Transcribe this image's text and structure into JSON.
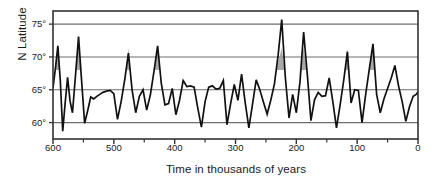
{
  "figure": {
    "background": "#ffffff",
    "line_color": "#111111",
    "fill_color": "#9a9a9a",
    "grid_color": "#6e6e6e",
    "frame_color": "#333333"
  },
  "chart_data": {
    "type": "line",
    "title": "",
    "xlabel": "Time in thousands of years",
    "ylabel": "N Latitude",
    "xlim": [
      600,
      0
    ],
    "ylim": [
      57.5,
      77.0
    ],
    "x_reversed": true,
    "grid": true,
    "grid_y": [
      60,
      65,
      70,
      75
    ],
    "legend": null,
    "xticks": [
      600,
      500,
      400,
      300,
      200,
      100,
      0
    ],
    "xtick_labels": [
      "600",
      "500",
      "400",
      "300",
      "200",
      "100",
      "0"
    ],
    "xminor_ticks": [
      550,
      450,
      350,
      250,
      150,
      50
    ],
    "yticks": [
      60,
      65,
      70,
      75
    ],
    "ytick_labels": [
      "60°",
      "65°",
      "70°",
      "75°"
    ],
    "shaded_band": [
      68.0,
      70.0
    ],
    "series": [
      {
        "name": "N Latitude",
        "x": [
          600,
          596,
          592,
          588,
          584,
          580,
          576,
          572,
          568,
          563,
          558,
          553,
          548,
          543,
          538,
          533,
          528,
          523,
          518,
          512,
          506,
          500,
          494,
          488,
          482,
          476,
          470,
          464,
          458,
          452,
          446,
          440,
          434,
          428,
          422,
          416,
          410,
          404,
          398,
          392,
          386,
          380,
          374,
          368,
          362,
          356,
          350,
          344,
          338,
          332,
          326,
          320,
          314,
          308,
          302,
          296,
          290,
          284,
          278,
          272,
          266,
          260,
          254,
          248,
          242,
          236,
          230,
          224,
          218,
          212,
          206,
          200,
          194,
          188,
          182,
          176,
          170,
          164,
          158,
          152,
          146,
          140,
          134,
          128,
          122,
          116,
          110,
          104,
          98,
          92,
          86,
          80,
          74,
          68,
          62,
          56,
          50,
          44,
          38,
          32,
          26,
          20,
          14,
          8,
          3,
          0
        ],
        "y": [
          65.3,
          68.3,
          71.7,
          66.4,
          58.7,
          63.0,
          66.9,
          63.3,
          61.5,
          67.2,
          73.1,
          66.4,
          59.9,
          61.8,
          63.9,
          63.6,
          64.0,
          64.3,
          64.6,
          64.8,
          64.9,
          64.4,
          60.5,
          63.2,
          66.6,
          70.6,
          65.0,
          61.5,
          64.0,
          65.0,
          61.9,
          64.2,
          67.8,
          71.7,
          66.0,
          62.7,
          62.9,
          65.2,
          61.2,
          63.4,
          66.4,
          65.5,
          65.6,
          65.4,
          62.2,
          59.3,
          63.2,
          65.4,
          65.6,
          65.1,
          65.2,
          66.4,
          59.7,
          62.9,
          65.8,
          63.4,
          67.4,
          63.0,
          59.2,
          62.8,
          66.5,
          65.0,
          63.1,
          61.3,
          63.4,
          65.9,
          70.2,
          75.7,
          66.8,
          60.7,
          64.3,
          61.5,
          66.2,
          73.8,
          67.4,
          60.3,
          63.5,
          64.6,
          64.0,
          64.1,
          66.8,
          63.2,
          59.2,
          62.7,
          66.5,
          70.8,
          63.0,
          65.0,
          64.9,
          60.0,
          64.3,
          68.2,
          72.0,
          64.3,
          61.5,
          63.6,
          65.2,
          66.8,
          68.7,
          65.6,
          63.2,
          60.2,
          62.4,
          64.0,
          64.3,
          64.7
        ]
      }
    ]
  }
}
